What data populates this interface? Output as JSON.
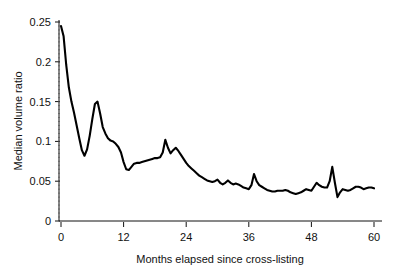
{
  "chart_data": {
    "type": "line",
    "title": "",
    "xlabel": "Months elapsed since cross-listing",
    "ylabel": "Median volume ratio",
    "xlim": [
      0,
      60
    ],
    "ylim": [
      0,
      0.25
    ],
    "xticks": [
      0,
      12,
      24,
      36,
      48,
      60
    ],
    "xticklabels": [
      "0",
      "12",
      "24",
      "36",
      "48",
      "60"
    ],
    "yticks": [
      0,
      0.05,
      0.1,
      0.15,
      0.2,
      0.25
    ],
    "yticklabels": [
      "0",
      "0.05",
      "0.1",
      "0.15",
      "0.2",
      "0.25"
    ],
    "grid": false,
    "legend": null,
    "series": [
      {
        "name": "Median volume ratio",
        "color": "#000000",
        "x": [
          0,
          1,
          2,
          3,
          4,
          5,
          6,
          7,
          8,
          9,
          10,
          11,
          12,
          13,
          14,
          15,
          16,
          17,
          18,
          19,
          20,
          21,
          22,
          23,
          24,
          25,
          26,
          27,
          28,
          29,
          30,
          31,
          32,
          33,
          34,
          35,
          36,
          37,
          38,
          39,
          40,
          41,
          42,
          43,
          44,
          45,
          46,
          47,
          48,
          49,
          50,
          51,
          52,
          53,
          54,
          55,
          56,
          57,
          58,
          59,
          60
        ],
        "values": [
          0.245,
          0.187,
          0.143,
          0.112,
          0.082,
          0.097,
          0.15,
          0.124,
          0.104,
          0.1,
          0.092,
          0.082,
          0.064,
          0.071,
          0.073,
          0.074,
          0.075,
          0.077,
          0.079,
          0.081,
          0.102,
          0.085,
          0.092,
          0.086,
          0.073,
          0.066,
          0.062,
          0.057,
          0.052,
          0.049,
          0.051,
          0.046,
          0.05,
          0.048,
          0.046,
          0.042,
          0.04,
          0.059,
          0.045,
          0.041,
          0.038,
          0.037,
          0.038,
          0.039,
          0.036,
          0.034,
          0.036,
          0.04,
          0.038,
          0.048,
          0.043,
          0.042,
          0.03,
          0.04,
          0.038,
          0.041,
          0.043,
          0.04,
          0.042,
          0.041,
          0.039
        ]
      }
    ],
    "series_detail": {
      "note": "Monthly median volume ratio sampled at each month from cross-listing month 0 through month 60",
      "peak_initial": 0.245,
      "peak_month4": 0.15,
      "peak_month12": 0.102,
      "peak_month24": 0.059,
      "peak_month51": 0.068,
      "final_value": 0.039
    },
    "dense_x": [
      0,
      0.5,
      1,
      1.5,
      2,
      2.5,
      3,
      3.5,
      4,
      4.5,
      5,
      5.5,
      6,
      6.5,
      7,
      7.5,
      8,
      8.5,
      9,
      9.5,
      10,
      10.5,
      11,
      11.5,
      12,
      12.5,
      13,
      13.5,
      14,
      14.5,
      15,
      15.5,
      16,
      16.5,
      17,
      17.5,
      18,
      18.5,
      19,
      19.5,
      20,
      20.5,
      21,
      21.5,
      22,
      22.5,
      23,
      23.5,
      24,
      24.5,
      25,
      25.5,
      26,
      26.5,
      27,
      27.5,
      28,
      28.5,
      29,
      29.5,
      30,
      30.5,
      31,
      31.5,
      32,
      32.5,
      33,
      33.5,
      34,
      34.5,
      35,
      35.5,
      36,
      36.5,
      37,
      37.5,
      38,
      38.5,
      39,
      39.5,
      40,
      40.5,
      41,
      41.5,
      42,
      42.5,
      43,
      43.5,
      44,
      44.5,
      45,
      45.5,
      46,
      46.5,
      47,
      47.5,
      48,
      48.5,
      49,
      49.5,
      50,
      50.5,
      51,
      51.5,
      52,
      52.5,
      53,
      53.5,
      54,
      54.5,
      55,
      55.5,
      56,
      56.5,
      57,
      57.5,
      58,
      58.5,
      59,
      59.5,
      60
    ],
    "dense_y": [
      0.245,
      0.232,
      0.196,
      0.168,
      0.15,
      0.136,
      0.12,
      0.104,
      0.089,
      0.082,
      0.09,
      0.107,
      0.128,
      0.147,
      0.15,
      0.135,
      0.118,
      0.11,
      0.104,
      0.101,
      0.1,
      0.097,
      0.093,
      0.086,
      0.074,
      0.065,
      0.064,
      0.068,
      0.072,
      0.073,
      0.073,
      0.074,
      0.075,
      0.076,
      0.077,
      0.078,
      0.079,
      0.079,
      0.08,
      0.086,
      0.102,
      0.092,
      0.085,
      0.089,
      0.092,
      0.088,
      0.083,
      0.078,
      0.073,
      0.069,
      0.066,
      0.063,
      0.06,
      0.057,
      0.055,
      0.053,
      0.051,
      0.05,
      0.049,
      0.05,
      0.052,
      0.048,
      0.046,
      0.048,
      0.051,
      0.048,
      0.046,
      0.047,
      0.046,
      0.044,
      0.042,
      0.041,
      0.04,
      0.045,
      0.059,
      0.05,
      0.045,
      0.043,
      0.041,
      0.039,
      0.038,
      0.037,
      0.037,
      0.038,
      0.038,
      0.038,
      0.039,
      0.038,
      0.036,
      0.035,
      0.034,
      0.035,
      0.036,
      0.038,
      0.04,
      0.039,
      0.038,
      0.043,
      0.048,
      0.045,
      0.043,
      0.042,
      0.042,
      0.05,
      0.068,
      0.048,
      0.03,
      0.036,
      0.04,
      0.039,
      0.038,
      0.039,
      0.041,
      0.043,
      0.043,
      0.042,
      0.04,
      0.041,
      0.042,
      0.042,
      0.041,
      0.04,
      0.039
    ]
  }
}
